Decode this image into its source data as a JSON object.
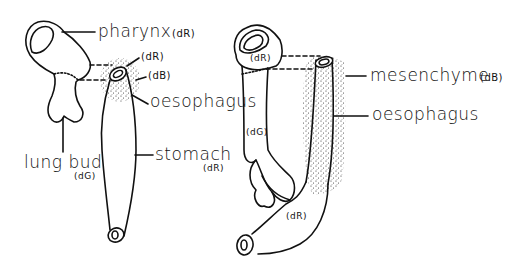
{
  "figure": {
    "left_panel": {
      "labels": {
        "pharynx": "pharynx",
        "pharynx_tag": "(dR)",
        "oes_ring_tag": "(dR)",
        "oes_mes_tag": "(dB)",
        "oesophagus": "oesophagus",
        "lung_bud": "lung bud",
        "lung_bud_tag": "(dG)",
        "stomach": "stomach",
        "stomach_tag": "(dR)"
      }
    },
    "right_panel": {
      "labels": {
        "pharynx_tag": "(dR)",
        "lung_tag": "(dG)",
        "stomach_tag": "(dR)",
        "mesenchyme": "mesenchyme",
        "mesenchyme_tag": "(dB)",
        "oesophagus": "oesophagus"
      }
    }
  }
}
